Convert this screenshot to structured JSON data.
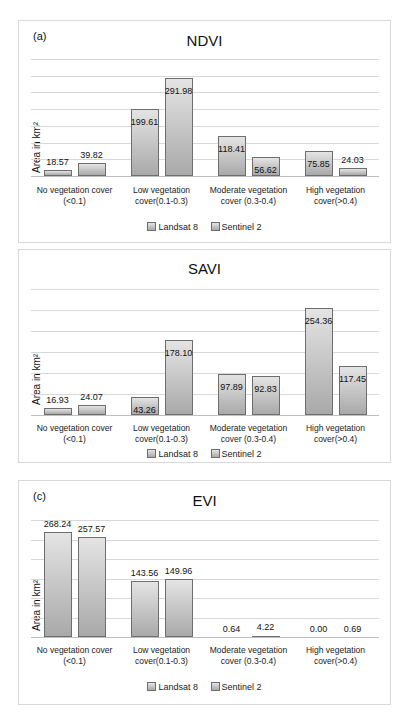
{
  "chart_data": [
    {
      "type": "bar",
      "panel_label": "(a)",
      "title": "NDVI",
      "xlabel": "",
      "ylabel": "Area in km²",
      "ylim": [
        0,
        350
      ],
      "grid": true,
      "legend_position": "bottom",
      "categories": [
        "No vegetation cover (<0.1)",
        "Low vegetation cover(0.1-0.3)",
        "Moderate vegetation cover (0.3-0.4)",
        "High vegetation cover(>0.4)"
      ],
      "series": [
        {
          "name": "Landsat 8",
          "values": [
            18.57,
            199.61,
            118.41,
            75.85
          ]
        },
        {
          "name": "Sentinel 2",
          "values": [
            39.82,
            291.98,
            56.62,
            24.03
          ]
        }
      ]
    },
    {
      "type": "bar",
      "panel_label": "",
      "title": "SAVI",
      "xlabel": "",
      "ylabel": "Area in km²",
      "ylim": [
        0,
        300
      ],
      "grid": true,
      "legend_position": "bottom",
      "categories": [
        "No vegetation cover (<0.1)",
        "Low vegetation cover(0.1-0.3)",
        "Moderate vegetation cover (0.3-0.4)",
        "High vegetation cover(>0.4)"
      ],
      "series": [
        {
          "name": "Landsat 8",
          "values": [
            16.93,
            43.26,
            97.89,
            254.36
          ]
        },
        {
          "name": "Sentinel 2",
          "values": [
            24.07,
            178.1,
            92.83,
            117.45
          ]
        }
      ]
    },
    {
      "type": "bar",
      "panel_label": "(c)",
      "title": "EVI",
      "xlabel": "",
      "ylabel": "Area in km²",
      "ylim": [
        0,
        300
      ],
      "grid": true,
      "legend_position": "bottom",
      "categories": [
        "No vegetation cover (<0.1)",
        "Low vegetation cover(0.1-0.3)",
        "Moderate vegetation cover (0.3-0.4)",
        "High vegetation cover(>0.4)"
      ],
      "series": [
        {
          "name": "Landsat 8",
          "values": [
            268.24,
            143.56,
            0.64,
            0.0
          ]
        },
        {
          "name": "Sentinel 2",
          "values": [
            257.57,
            149.96,
            4.22,
            0.69
          ]
        }
      ]
    }
  ],
  "panels": [
    {
      "label": "(a)",
      "title": "NDVI",
      "ylabel": "Area in km²",
      "categories": [
        [
          "No vegetation cover",
          "(<0.1)"
        ],
        [
          "Low vegetation",
          "cover(0.1-0.3)"
        ],
        [
          "Moderate vegetation",
          "cover (0.3-0.4)"
        ],
        [
          "High vegetation",
          "cover(>0.4)"
        ]
      ],
      "value_labels": [
        [
          "18.57",
          "39.82"
        ],
        [
          "199.61",
          "291.98"
        ],
        [
          "118.41",
          "56.62"
        ],
        [
          "75.85",
          "24.03"
        ]
      ],
      "legend": [
        "Landsat 8",
        "Sentinel 2"
      ]
    },
    {
      "label": "",
      "title": "SAVI",
      "ylabel": "Area in km²",
      "categories": [
        [
          "No vegetation cover",
          "(<0.1)"
        ],
        [
          "Low vegetation",
          "cover(0.1-0.3)"
        ],
        [
          "Moderate vegetation",
          "cover (0.3-0.4)"
        ],
        [
          "High vegetation",
          "cover(>0.4)"
        ]
      ],
      "value_labels": [
        [
          "16.93",
          "24.07"
        ],
        [
          "43.26",
          "178.10"
        ],
        [
          "97.89",
          "92.83"
        ],
        [
          "254.36",
          "117.45"
        ]
      ],
      "legend": [
        "Landsat 8",
        "Sentinel 2"
      ]
    },
    {
      "label": "(c)",
      "title": "EVI",
      "ylabel": "Area in km²",
      "categories": [
        [
          "No vegetation cover",
          "(<0.1)"
        ],
        [
          "Low vegetation",
          "cover(0.1-0.3)"
        ],
        [
          "Moderate vegetation",
          "cover (0.3-0.4)"
        ],
        [
          "High vegetation",
          "cover(>0.4)"
        ]
      ],
      "value_labels": [
        [
          "268.24",
          "257.57"
        ],
        [
          "143.56",
          "149.96"
        ],
        [
          "0.64",
          "4.22"
        ],
        [
          "0.00",
          "0.69"
        ]
      ],
      "legend": [
        "Landsat 8",
        "Sentinel 2"
      ]
    }
  ],
  "colors": {
    "bar_top": "#e4e4e4",
    "bar_bottom": "#a9a9a9",
    "bar_border": "#6e6e6e",
    "gridline": "#d8d8d8"
  }
}
